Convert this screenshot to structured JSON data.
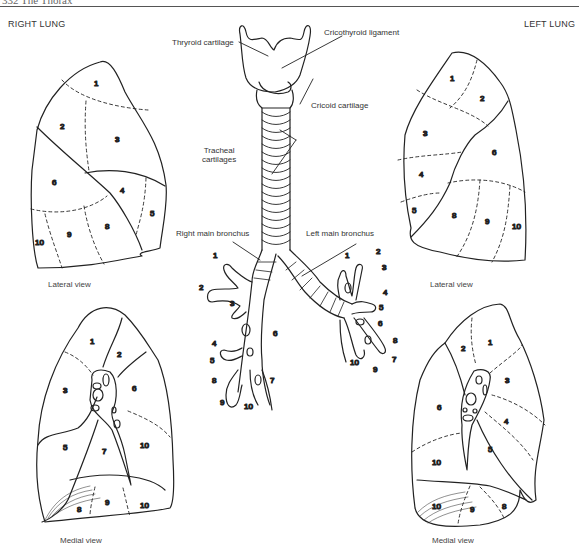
{
  "page": {
    "running_head": "332  The Thorax",
    "right_title": "RIGHT LUNG",
    "left_title": "LEFT LUNG"
  },
  "larynx_labels": {
    "thyroid_cartilage": "Thryroid cartilage",
    "cricothyroid_ligament": "Cricothyroid ligament",
    "cricoid_cartilage": "Cricoid cartilage",
    "tracheal_cartilages_line1": "Tracheal",
    "tracheal_cartilages_line2": "cartilages",
    "right_main_bronchus": "Right main bronchus",
    "left_main_bronchus": "Left main bronchus"
  },
  "views": {
    "right_lateral": "Lateral view",
    "left_lateral": "Lateral view",
    "right_medial": "Medial view",
    "left_medial": "Medial view"
  },
  "segments": {
    "right_lateral": [
      "1",
      "2",
      "3",
      "4",
      "5",
      "6",
      "8",
      "9",
      "10"
    ],
    "left_lateral": [
      "1",
      "2",
      "3",
      "4",
      "5",
      "6",
      "8",
      "9",
      "10"
    ],
    "right_medial": [
      "1",
      "2",
      "3",
      "5",
      "6",
      "7",
      "10",
      "8",
      "9",
      "10"
    ],
    "left_medial": [
      "1",
      "2",
      "3",
      "4",
      "5",
      "6",
      "10",
      "10",
      "9",
      "8"
    ],
    "right_bronchus": [
      "1",
      "2",
      "3",
      "4",
      "5",
      "6",
      "7",
      "8",
      "9",
      "10"
    ],
    "left_bronchus": [
      "1",
      "2",
      "3",
      "4",
      "5",
      "6",
      "7",
      "8",
      "9",
      "10"
    ]
  }
}
